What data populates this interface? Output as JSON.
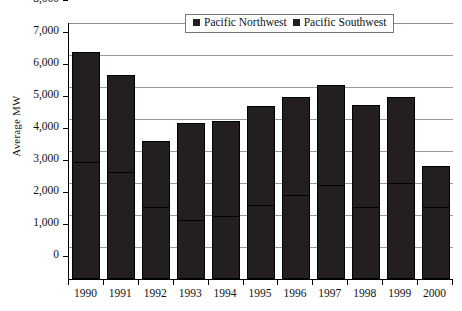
{
  "chart_data": {
    "type": "bar",
    "stacked": true,
    "title": "",
    "xlabel": "",
    "ylabel": "Average MW",
    "ylim": [
      0,
      8000
    ],
    "ytick_step": 1000,
    "ytick_labels": [
      "8,000",
      "7,000",
      "6,000",
      "5,000",
      "4,000",
      "3,000",
      "2,000",
      "1,000",
      "0"
    ],
    "ytick_values": [
      8000,
      7000,
      6000,
      5000,
      4000,
      3000,
      2000,
      1000,
      0
    ],
    "grid": true,
    "legend_position": "top-center",
    "categories": [
      "1990",
      "1991",
      "1992",
      "1993",
      "1994",
      "1995",
      "1996",
      "1997",
      "1998",
      "1999",
      "2000"
    ],
    "series": [
      {
        "name": "Pacific Northwest",
        "color": "#231f20",
        "values": [
          3620,
          3300,
          2220,
          1820,
          1950,
          2280,
          2580,
          2900,
          2230,
          2980,
          2230
        ]
      },
      {
        "name": "Pacific Southwest",
        "color": "#231f20",
        "values": [
          3480,
          3080,
          2080,
          3060,
          3000,
          3120,
          3100,
          3150,
          3200,
          2700,
          1290
        ]
      }
    ],
    "totals": [
      7100,
      6380,
      4300,
      4880,
      4950,
      5400,
      5680,
      6050,
      5430,
      5680,
      3520
    ]
  },
  "legend": {
    "items": [
      {
        "label": "Pacific Northwest",
        "swatch": "legend-swatch-icon"
      },
      {
        "label": "Pacific Southwest",
        "swatch": "legend-swatch-icon"
      }
    ]
  },
  "axis": {
    "y_title": "Average MW"
  }
}
